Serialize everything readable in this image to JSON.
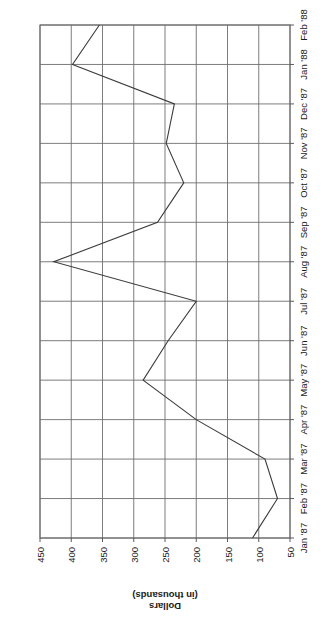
{
  "chart_data": {
    "type": "line",
    "title": "",
    "subtitle": "",
    "xlabel": "",
    "ylabel": "Dollars\n(in thousands)",
    "ylabel_lines": [
      "Dollars",
      "(in thousands)"
    ],
    "categories": [
      "Jan '87",
      "Feb '87",
      "Mar '87",
      "Apr '87",
      "May '87",
      "Jun '87",
      "Jul '87",
      "Aug '87",
      "Sep '87",
      "Oct '87",
      "Nov '87",
      "Dec '87",
      "Jan '88",
      "Feb '88"
    ],
    "values": [
      110,
      70,
      90,
      200,
      285,
      245,
      200,
      428,
      262,
      220,
      248,
      235,
      398,
      355
    ],
    "ytick_labels": [
      "50",
      "100",
      "150",
      "200",
      "250",
      "300",
      "350",
      "400",
      "450"
    ],
    "yticks": [
      50,
      100,
      150,
      200,
      250,
      300,
      350,
      400,
      450
    ],
    "ylim": [
      50,
      450
    ],
    "grid": true,
    "legend": false,
    "legend_position": "none",
    "series": [
      {
        "name": "Dollars (in thousands)",
        "values": [
          110,
          70,
          90,
          200,
          285,
          245,
          200,
          428,
          262,
          220,
          248,
          235,
          398,
          355
        ]
      }
    ],
    "line_color": "#3b3b3b",
    "grid_color": "#6e6e6e",
    "axis_color": "#4a4a4a",
    "background_color": "#ffffff",
    "orientation": "rotated-90-ccw",
    "markers": false
  },
  "figure": {
    "corner_mark": "▸"
  }
}
